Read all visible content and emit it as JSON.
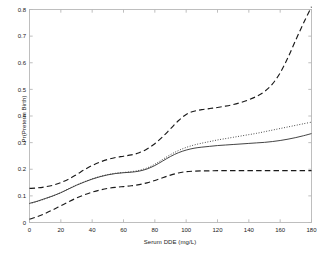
{
  "chart_data": {
    "type": "line",
    "title": "",
    "xlabel": "Serum DDE (mg/L)",
    "ylabel": "Pr(Preterm Birth)",
    "xlim": [
      0,
      180
    ],
    "ylim": [
      0,
      0.8
    ],
    "xticks": [
      0,
      20,
      40,
      60,
      80,
      100,
      120,
      140,
      160,
      180
    ],
    "yticks": [
      0,
      0.1,
      0.2,
      0.3,
      0.4,
      0.5,
      0.6,
      0.7,
      0.8
    ],
    "xtick_labels": [
      "0",
      "20",
      "40",
      "60",
      "80",
      "100",
      "120",
      "140",
      "160",
      "180"
    ],
    "ytick_labels": [
      "0",
      "0.1",
      "0.2",
      "0.3",
      "0.4",
      "0.5",
      "0.6",
      "0.7",
      "0.8"
    ],
    "grid": false,
    "legend": null,
    "box": true,
    "series": [
      {
        "name": "Posterior mean",
        "style": "solid",
        "color": "#3a3a3a",
        "x": [
          0,
          5,
          10,
          15,
          20,
          25,
          30,
          35,
          40,
          45,
          50,
          55,
          60,
          65,
          70,
          75,
          80,
          85,
          90,
          95,
          100,
          105,
          110,
          115,
          120,
          125,
          130,
          135,
          140,
          145,
          150,
          155,
          160,
          165,
          170,
          175,
          180
        ],
        "y": [
          0.072,
          0.08,
          0.09,
          0.1,
          0.112,
          0.126,
          0.14,
          0.152,
          0.163,
          0.172,
          0.179,
          0.184,
          0.187,
          0.189,
          0.193,
          0.201,
          0.214,
          0.231,
          0.248,
          0.262,
          0.272,
          0.279,
          0.283,
          0.286,
          0.289,
          0.291,
          0.293,
          0.295,
          0.297,
          0.299,
          0.301,
          0.304,
          0.308,
          0.313,
          0.319,
          0.326,
          0.334
        ]
      },
      {
        "name": "Alternative estimate",
        "style": "dotted",
        "color": "#3a3a3a",
        "x": [
          0,
          5,
          10,
          15,
          20,
          25,
          30,
          35,
          40,
          45,
          50,
          55,
          60,
          65,
          70,
          75,
          80,
          85,
          90,
          95,
          100,
          105,
          110,
          115,
          120,
          125,
          130,
          135,
          140,
          145,
          150,
          155,
          160,
          165,
          170,
          175,
          180
        ],
        "y": [
          0.071,
          0.079,
          0.089,
          0.1,
          0.112,
          0.127,
          0.141,
          0.153,
          0.164,
          0.173,
          0.18,
          0.185,
          0.188,
          0.191,
          0.196,
          0.205,
          0.219,
          0.237,
          0.255,
          0.27,
          0.282,
          0.291,
          0.298,
          0.304,
          0.31,
          0.315,
          0.32,
          0.325,
          0.33,
          0.335,
          0.341,
          0.347,
          0.353,
          0.359,
          0.365,
          0.371,
          0.377
        ]
      },
      {
        "name": "Upper credible bound",
        "style": "dashed",
        "color": "#1a1a1a",
        "x": [
          0,
          5,
          10,
          15,
          20,
          25,
          30,
          35,
          40,
          45,
          50,
          55,
          60,
          65,
          70,
          75,
          80,
          85,
          90,
          95,
          100,
          105,
          110,
          115,
          120,
          125,
          130,
          135,
          140,
          145,
          150,
          155,
          160,
          165,
          170,
          175,
          180
        ],
        "y": [
          0.128,
          0.13,
          0.134,
          0.14,
          0.15,
          0.163,
          0.18,
          0.198,
          0.214,
          0.227,
          0.237,
          0.244,
          0.249,
          0.254,
          0.262,
          0.276,
          0.296,
          0.322,
          0.352,
          0.382,
          0.406,
          0.418,
          0.424,
          0.428,
          0.432,
          0.437,
          0.443,
          0.451,
          0.461,
          0.474,
          0.492,
          0.52,
          0.562,
          0.62,
          0.686,
          0.75,
          0.81
        ]
      },
      {
        "name": "Lower credible bound",
        "style": "dashed",
        "color": "#1a1a1a",
        "x": [
          0,
          5,
          10,
          15,
          20,
          25,
          30,
          35,
          40,
          45,
          50,
          55,
          60,
          65,
          70,
          75,
          80,
          85,
          90,
          95,
          100,
          105,
          110,
          115,
          120,
          125,
          130,
          135,
          140,
          145,
          150,
          155,
          160,
          165,
          170,
          175,
          180
        ],
        "y": [
          0.012,
          0.022,
          0.034,
          0.048,
          0.063,
          0.078,
          0.092,
          0.104,
          0.114,
          0.122,
          0.128,
          0.132,
          0.135,
          0.138,
          0.142,
          0.149,
          0.158,
          0.168,
          0.178,
          0.186,
          0.191,
          0.193,
          0.194,
          0.194,
          0.195,
          0.195,
          0.195,
          0.195,
          0.195,
          0.195,
          0.195,
          0.195,
          0.195,
          0.195,
          0.195,
          0.195,
          0.195
        ]
      }
    ]
  }
}
